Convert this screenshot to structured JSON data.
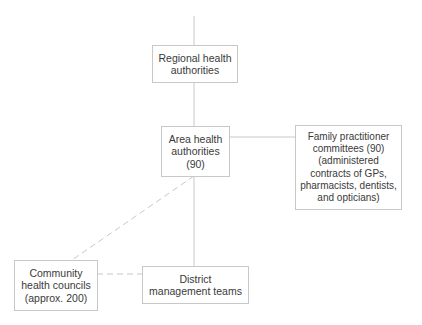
{
  "diagram": {
    "nodes": {
      "regional": {
        "label": "Regional health\nauthorities"
      },
      "area": {
        "label": "Area health\nauthorities\n(90)"
      },
      "family": {
        "label": "Family practitioner\ncommittees (90)\n(administered\ncontracts of GPs,\npharmacists, dentists,\nand opticians)"
      },
      "community": {
        "label": "Community\nhealth councils\n(approx. 200)"
      },
      "district": {
        "label": "District\nmanagement teams"
      }
    },
    "edges": [
      {
        "from": "top",
        "to": "regional",
        "style": "solid"
      },
      {
        "from": "regional",
        "to": "area",
        "style": "solid"
      },
      {
        "from": "area",
        "to": "family",
        "style": "solid"
      },
      {
        "from": "area",
        "to": "district",
        "style": "solid"
      },
      {
        "from": "area",
        "to": "community",
        "style": "dashed"
      },
      {
        "from": "community",
        "to": "district",
        "style": "dashed"
      }
    ],
    "colors": {
      "line": "#c8c8c8",
      "text": "#3a3a3a",
      "border": "#c8c8c8"
    }
  }
}
